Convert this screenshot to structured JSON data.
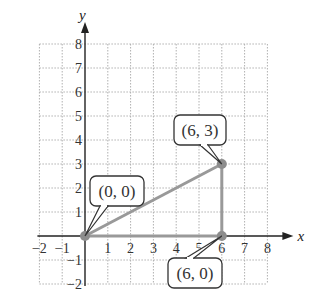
{
  "chart_data": {
    "type": "line",
    "title": "",
    "xlabel": "x",
    "ylabel": "y",
    "xlim": [
      -2,
      8
    ],
    "ylim": [
      -2,
      8
    ],
    "grid": true,
    "x_ticks": [
      "−2",
      "−1",
      "1",
      "2",
      "3",
      "4",
      "5",
      "6",
      "7",
      "8"
    ],
    "y_ticks": [
      "−2",
      "−1",
      "1",
      "2",
      "3",
      "4",
      "5",
      "6",
      "7",
      "8"
    ],
    "points": [
      {
        "x": 0,
        "y": 0,
        "label": "(0, 0)"
      },
      {
        "x": 6,
        "y": 3,
        "label": "(6, 3)"
      },
      {
        "x": 6,
        "y": 0,
        "label": "(6, 0)"
      }
    ],
    "segments": [
      {
        "from": [
          0,
          0
        ],
        "to": [
          6,
          3
        ]
      },
      {
        "from": [
          6,
          3
        ],
        "to": [
          6,
          0
        ]
      },
      {
        "from": [
          0,
          0
        ],
        "to": [
          6,
          0
        ]
      }
    ],
    "colors": {
      "shape": "#999999",
      "axis": "#222222",
      "grid": "#b0b0b0"
    }
  }
}
